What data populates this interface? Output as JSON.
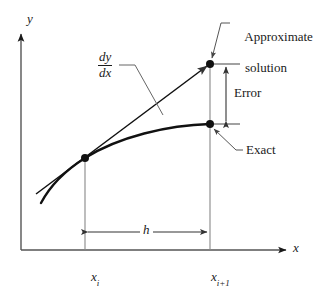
{
  "figure": {
    "kind": "euler-method-error-diagram",
    "background_color": "#ffffff",
    "line_color": "#1a1a1a",
    "thin_line_color": "#555555",
    "axes": {
      "y_label": "y",
      "x_label": "x",
      "y_axis_x": 21,
      "y_axis_top": 32,
      "y_axis_bottom": 250,
      "x_axis_y": 250,
      "x_axis_left": 21,
      "x_axis_right": 288
    },
    "points": {
      "start": {
        "label": "",
        "x": 85,
        "y": 158
      },
      "approximate": {
        "label": "",
        "x": 210,
        "y": 64
      },
      "exact": {
        "label": "",
        "x": 210,
        "y": 124
      }
    },
    "ticks": [
      {
        "name": "x-i",
        "label": "x",
        "subscript": "i",
        "x": 85
      },
      {
        "name": "x-i-plus-1",
        "label": "x",
        "subscript": "i+1",
        "x": 210
      }
    ],
    "annotations": {
      "derivative": {
        "numerator": "dy",
        "denominator": "dx"
      },
      "approximate_solution": {
        "line1": "Approximate",
        "line2": "solution"
      },
      "error": {
        "label": "Error"
      },
      "exact": {
        "label": "Exact"
      },
      "step": {
        "label": "h"
      }
    }
  }
}
